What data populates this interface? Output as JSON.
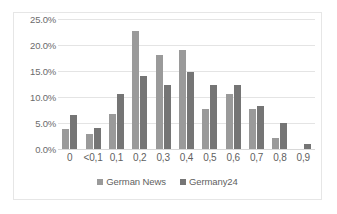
{
  "chart_data": {
    "type": "bar",
    "title": "",
    "subtitle": "",
    "xlabel": "",
    "ylabel": "",
    "ylim": [
      0,
      25
    ],
    "yticks": [
      0,
      5,
      10,
      15,
      20,
      25
    ],
    "ytick_labels": [
      "0.0%",
      "5.0%",
      "10.0%",
      "15.0%",
      "20.0%",
      "25.0%"
    ],
    "grid": true,
    "legend_position": "bottom",
    "categories": [
      "0",
      "<0,1",
      "0,1",
      "0,2",
      "0,3",
      "0,4",
      "0,5",
      "0,6",
      "0,7",
      "0,8",
      "0,9"
    ],
    "series": [
      {
        "name": "German News",
        "color": "#9a9a9a",
        "values": [
          3.8,
          2.9,
          6.7,
          22.6,
          18.0,
          19.0,
          7.7,
          10.6,
          7.7,
          2.2,
          0.0
        ]
      },
      {
        "name": "Germany24",
        "color": "#757575",
        "values": [
          6.5,
          4.1,
          10.6,
          14.1,
          12.4,
          14.8,
          12.4,
          12.4,
          8.3,
          5.0,
          0.9
        ]
      }
    ]
  }
}
